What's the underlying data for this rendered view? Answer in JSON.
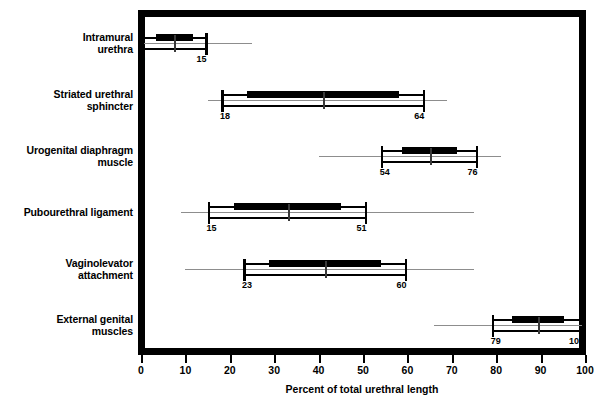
{
  "chart_data": {
    "type": "bar",
    "title": "",
    "subtitle": "",
    "xlabel": "Percent of total urethral length",
    "ylabel": "",
    "xlim": [
      0,
      100
    ],
    "xticks": [
      0,
      10,
      20,
      30,
      40,
      50,
      60,
      70,
      80,
      90,
      100
    ],
    "grid": false,
    "legend": null,
    "orientation": "horizontal",
    "categories": [
      "Intramural urethra",
      "Striated urethral sphincter",
      "Urogenital diaphragm muscle",
      "Pubourethral ligament",
      "Vaginolevator attachment",
      "External genital muscles"
    ],
    "series": [
      {
        "name": "Range of urethral length",
        "items": [
          {
            "category": "Intramural urethra",
            "label_lines": "Intramural\nurethra",
            "low": 0,
            "high": 15,
            "whisker_low": 0,
            "whisker_high": 25,
            "low_label": "0",
            "high_label": "15"
          },
          {
            "category": "Striated urethral sphincter",
            "label_lines": "Striated urethral\nsphincter",
            "low": 18,
            "high": 64,
            "whisker_low": 15,
            "whisker_high": 69,
            "low_label": "18",
            "high_label": "64"
          },
          {
            "category": "Urogenital diaphragm muscle",
            "label_lines": "Urogenital diaphragm\nmuscle",
            "low": 54,
            "high": 76,
            "whisker_low": 40,
            "whisker_high": 81,
            "low_label": "54",
            "high_label": "76"
          },
          {
            "category": "Pubourethral ligament",
            "label_lines": "Pubourethral ligament",
            "low": 15,
            "high": 51,
            "whisker_low": 9,
            "whisker_high": 75,
            "low_label": "15",
            "high_label": "51"
          },
          {
            "category": "Vaginolevator attachment",
            "label_lines": "Vaginolevator\nattachment",
            "low": 23,
            "high": 60,
            "whisker_low": 10,
            "whisker_high": 75,
            "low_label": "23",
            "high_label": "60"
          },
          {
            "category": "External genital muscles",
            "label_lines": "External genital\nmuscles",
            "low": 79,
            "high": 100,
            "whisker_low": 66,
            "whisker_high": 100,
            "low_label": "79",
            "high_label": "100"
          }
        ]
      }
    ]
  },
  "colors": {
    "bar": "#000000",
    "whisker": "#8d8d8d",
    "frame": "#000000",
    "background": "#ffffff",
    "text": "#000000"
  }
}
